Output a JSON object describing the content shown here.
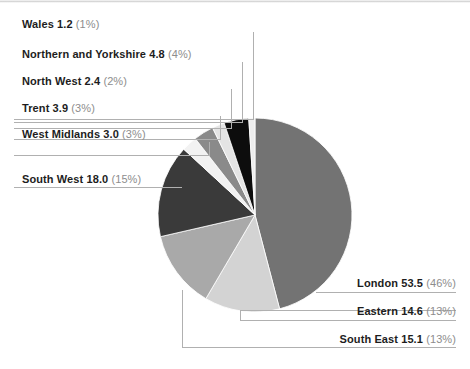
{
  "chart_data": {
    "type": "pie",
    "title": "",
    "subtitle": "",
    "xlabel": "",
    "ylabel": "",
    "legend_position": "callout-labels",
    "unit": "",
    "total": 116.5,
    "categories": [
      "London",
      "Eastern",
      "South East",
      "South West",
      "West Midlands",
      "Trent",
      "North West",
      "Northern and Yorkshire",
      "Wales"
    ],
    "values": [
      53.5,
      14.6,
      15.1,
      18.0,
      3.0,
      3.9,
      2.4,
      4.8,
      1.2
    ],
    "percents": [
      46,
      13,
      13,
      15,
      3,
      3,
      2,
      4,
      1
    ],
    "colors": [
      "#737373",
      "#d3d3d3",
      "#a9a9a9",
      "#3a3a3a",
      "#f2f2f2",
      "#8a8a8a",
      "#e4e4e4",
      "#0d0d0d",
      "#ededed"
    ],
    "slices": [
      {
        "name": "London",
        "value": 53.5,
        "percent": 46,
        "color": "#737373"
      },
      {
        "name": "Eastern",
        "value": 14.6,
        "percent": 13,
        "color": "#d3d3d3"
      },
      {
        "name": "South East",
        "value": 15.1,
        "percent": 13,
        "color": "#a9a9a9"
      },
      {
        "name": "South West",
        "value": 18.0,
        "percent": 15,
        "color": "#3a3a3a"
      },
      {
        "name": "West Midlands",
        "value": 3.0,
        "percent": 3,
        "color": "#f2f2f2"
      },
      {
        "name": "Trent",
        "value": 3.9,
        "percent": 3,
        "color": "#8a8a8a"
      },
      {
        "name": "North West",
        "value": 2.4,
        "percent": 2,
        "color": "#e4e4e4"
      },
      {
        "name": "Northern and Yorkshire",
        "value": 4.8,
        "percent": 4,
        "color": "#0d0d0d"
      },
      {
        "name": "Wales",
        "value": 1.2,
        "percent": 1,
        "color": "#ededed"
      }
    ]
  },
  "labels": {
    "wales": {
      "name": "Wales 1.2",
      "percent": "(1%)"
    },
    "northern": {
      "name": "Northern and Yorkshire 4.8",
      "percent": "(4%)"
    },
    "north_west": {
      "name": "North West 2.4",
      "percent": "(2%)"
    },
    "trent": {
      "name": "Trent 3.9",
      "percent": "(3%)"
    },
    "west_mids": {
      "name": "West Midlands 3.0",
      "percent": "(3%)"
    },
    "south_west": {
      "name": "South West 18.0",
      "percent": "(15%)"
    },
    "london": {
      "name": "London 53.5",
      "percent": "(46%)"
    },
    "eastern": {
      "name": "Eastern 14.6",
      "percent": "(13%)"
    },
    "south_east": {
      "name": "South East 15.1",
      "percent": "(13%)"
    }
  }
}
